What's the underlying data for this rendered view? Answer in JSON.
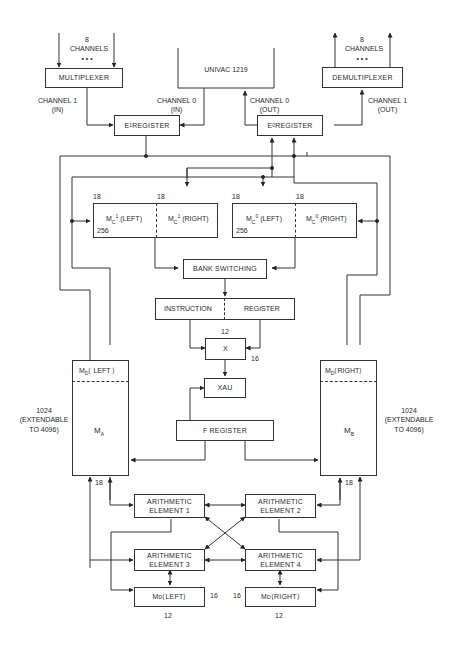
{
  "diagram": {
    "top": {
      "mux_channels": {
        "count": "8",
        "label": "CHANNELS",
        "dots": "• • •"
      },
      "demux_channels": {
        "count": "8",
        "label": "CHANNELS",
        "dots": "• • •"
      },
      "multiplexer": "MULTIPLEXER",
      "demultiplexer": "DEMULTIPLEXER",
      "univac": "UNIVAC 1219",
      "ch1_in": [
        "CHANNEL 1",
        "(IN)"
      ],
      "ch0_in": [
        "CHANNEL 0",
        "(IN)"
      ],
      "ch0_out": [
        "CHANNEL 0",
        "(OUT)"
      ],
      "ch1_out": [
        "CHANNEL 1",
        "(OUT)"
      ],
      "e1_register": {
        "base": "E",
        "sub": "1",
        "text": " REGISTER"
      },
      "e0_register": {
        "base": "E",
        "sub": "0",
        "text": " REGISTER"
      }
    },
    "control_memory": {
      "mc1_left": {
        "base": "M",
        "sub": "C",
        "sup": "1",
        "text": "(LEFT)"
      },
      "mc1_right": {
        "base": "M",
        "sub": "C",
        "sup": "1",
        "text": "(RIGHT)"
      },
      "mc0_left": {
        "base": "M",
        "sub": "C",
        "sup": "0",
        "text": "(LEFT)"
      },
      "mc0_right": {
        "base": "M",
        "sub": "C",
        "sup": "0",
        "text": "(RIGHT)"
      },
      "width_labels": [
        "18",
        "18",
        "18",
        "18"
      ],
      "depth_labels": [
        "256",
        "256"
      ]
    },
    "bank_switching": "BANK SWITCHING",
    "instruction_register": {
      "left": "INSTRUCTION",
      "right": "REGISTER"
    },
    "x": {
      "label": "X",
      "top_width": "12",
      "right_width": "16"
    },
    "xau": "XAU",
    "f_register": "F REGISTER",
    "ma": {
      "header": {
        "base": "M",
        "sub": "D",
        "text": "LEFT"
      },
      "label": {
        "base": "M",
        "sub": "A"
      },
      "size": [
        "1024",
        "(EXTENDABLE",
        "TO 4096)"
      ],
      "bottom_width": "18"
    },
    "mb": {
      "header": {
        "base": "M",
        "sub": "D",
        "text": "RIGHT"
      },
      "label": {
        "base": "M",
        "sub": "B"
      },
      "size": [
        "1024",
        "(EXTENDABLE",
        "TO 4096)"
      ],
      "bottom_width": "18"
    },
    "arithmetic_elements": [
      [
        "ARITHMETIC",
        "ELEMENT 1"
      ],
      [
        "ARITHMETIC",
        "ELEMENT 2"
      ],
      [
        "ARITHMETIC",
        "ELEMENT 3"
      ],
      [
        "ARITHMETIC",
        "ELEMENT 4"
      ]
    ],
    "md_left": {
      "base": "M",
      "sub": "D",
      "text": "LEFT",
      "side_width": "16",
      "bottom_width": "12"
    },
    "md_right": {
      "base": "M",
      "sub": "D",
      "text": "RIGHT",
      "side_width": "16",
      "bottom_width": "12"
    },
    "colors": {
      "line": "#333333",
      "background": "#ffffff",
      "text": "#2a2a2a"
    }
  }
}
